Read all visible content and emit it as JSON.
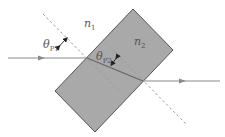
{
  "diagram": {
    "type": "refraction-through-slab",
    "labels": {
      "n1": {
        "main": "n",
        "sub": "1"
      },
      "n2": {
        "main": "n",
        "sub": "2"
      },
      "theta_p1": {
        "main": "θ",
        "sub": "P1"
      },
      "theta_p2": {
        "main": "θ",
        "sub": "P2"
      }
    },
    "colors": {
      "slab_fill": "#a9a9a9",
      "slab_edge": "#555555",
      "ray": "#8a8a8a",
      "normal_dashed": "#9a9a9a",
      "angle_arrow": "#222222",
      "text": "#555555"
    },
    "elements": [
      "incident-ray",
      "refracted-ray-inside-slab",
      "transmitted-ray",
      "normal-line-entry",
      "normal-line-exit",
      "slab-medium-n2",
      "surrounding-medium-n1"
    ]
  }
}
